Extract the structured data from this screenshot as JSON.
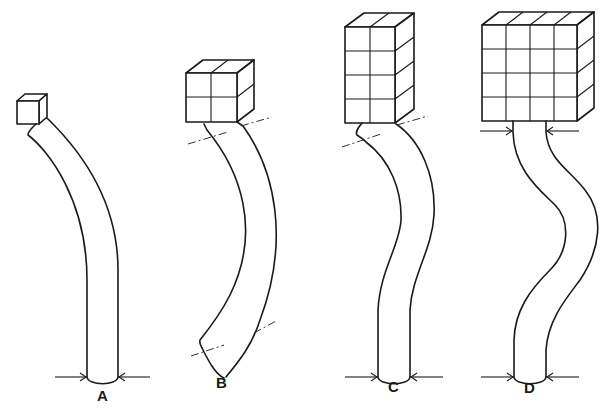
{
  "figure": {
    "background": "#ffffff",
    "ink": "#1a1a1a"
  },
  "panels": [
    {
      "label": "A",
      "load_grid": "1x1",
      "load_blocks": 1,
      "deflection": "single curve, fixed base",
      "base_arrows": true,
      "inflection_marks": 0
    },
    {
      "label": "B",
      "load_grid": "2x2",
      "load_blocks": 4,
      "deflection": "single arc, free ends",
      "base_arrows": false,
      "inflection_marks": 4
    },
    {
      "label": "C",
      "load_grid": "2x4",
      "load_blocks": 8,
      "deflection": "curve with one inflection, fixed base",
      "base_arrows": true,
      "inflection_marks": 2
    },
    {
      "label": "D",
      "load_grid": "4x4",
      "load_blocks": 16,
      "deflection": "S-curve, fixed top and base",
      "base_arrows": true,
      "top_arrows": true,
      "inflection_marks": 0
    }
  ]
}
